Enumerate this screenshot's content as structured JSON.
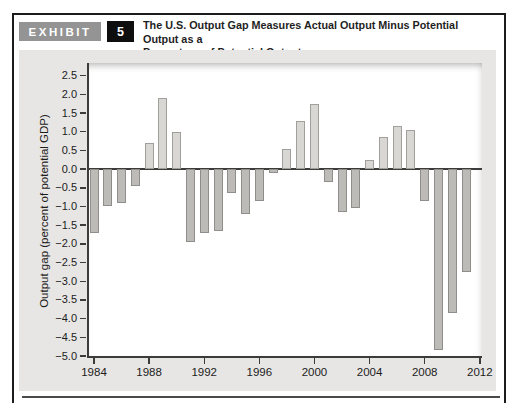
{
  "header": {
    "exhibit_label": "EXHIBIT",
    "exhibit_number": "5",
    "title_line1": "The U.S. Output Gap Measures Actual Output Minus Potential Output as a",
    "title_line2": "Percentage of Potential Output"
  },
  "chart_data": {
    "type": "bar",
    "title": "The U.S. Output Gap Measures Actual Output Minus Potential Output as a Percentage of Potential Output",
    "xlabel": "",
    "ylabel": "Output gap (percent of potential GDP)",
    "x": [
      1984,
      1985,
      1986,
      1987,
      1988,
      1989,
      1990,
      1991,
      1992,
      1993,
      1994,
      1995,
      1996,
      1997,
      1998,
      1999,
      2000,
      2001,
      2002,
      2003,
      2004,
      2005,
      2006,
      2007,
      2008,
      2009,
      2010,
      2011
    ],
    "values": [
      -1.7,
      -1.0,
      -0.9,
      -0.45,
      0.7,
      1.9,
      1.0,
      -1.95,
      -1.7,
      -1.65,
      -0.65,
      -1.2,
      -0.85,
      -0.1,
      0.55,
      1.3,
      1.75,
      -0.35,
      -1.15,
      -1.05,
      0.25,
      0.85,
      1.15,
      1.05,
      -0.85,
      -4.85,
      -3.85,
      -2.75
    ],
    "ylim": [
      -5.0,
      2.84
    ],
    "grid": false,
    "legend": "none",
    "ytick_values": [
      2.5,
      2.0,
      1.5,
      1.0,
      0.5,
      0.0,
      -0.5,
      -1.0,
      -1.5,
      -2.0,
      -2.5,
      -3.0,
      -3.5,
      -4.0,
      -4.5,
      -5.0
    ],
    "ytick_labels": [
      "2.5",
      "2.0",
      "1.5",
      "1.0",
      "0.5",
      "0.0",
      "−0.5",
      "−1.0",
      "−1.5",
      "−2.0",
      "−2.5",
      "−3.0",
      "−3.5",
      "−4.0",
      "−4.5",
      "−5.0"
    ],
    "xtick_years": [
      1984,
      1988,
      1992,
      1996,
      2000,
      2004,
      2008,
      2012
    ],
    "xtick_labels": [
      "1984",
      "1988",
      "1992",
      "1996",
      "2000",
      "2004",
      "2008",
      "2012"
    ],
    "colors": {
      "panel_background": "#e7e6e4",
      "plot_background": "#ffffff",
      "positive_fill": "#d8d7d3",
      "positive_border": "#a09f9b",
      "negative_fill": "#bcbbb7",
      "negative_border": "#8f8e8a",
      "axis": "#3c3c3a",
      "exhibit_box": "#949494",
      "exhibit_number_box": "#0e0e0e"
    }
  }
}
